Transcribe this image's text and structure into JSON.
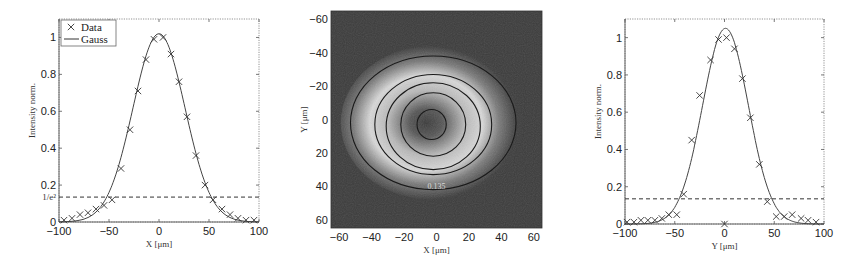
{
  "chart_data": [
    {
      "type": "scatter",
      "title": "",
      "xlabel": "X [μm]",
      "ylabel": "Intensity norm.",
      "xlim": [
        -100,
        100
      ],
      "ylim": [
        0,
        1.1
      ],
      "xticks": [
        -100,
        -50,
        0,
        50,
        100
      ],
      "yticks": [
        0,
        0.2,
        0.4,
        0.6,
        0.8,
        1
      ],
      "ytick_labels": [
        "0",
        "0.2",
        "0.4",
        "0.6",
        "0.8",
        "1"
      ],
      "extra_ytick": {
        "value": 0.135,
        "label": "1/e²"
      },
      "legend": {
        "position": "upper left",
        "entries": [
          "Data",
          "Gauss"
        ]
      },
      "threshold_line": {
        "y": 0.135,
        "style": "dashed"
      },
      "series": [
        {
          "name": "Data",
          "marker": "x",
          "x": [
            -95,
            -87,
            -79,
            -71,
            -63,
            -55,
            -47,
            -38,
            -29,
            -21,
            -13,
            -5,
            4,
            12,
            20,
            28,
            37,
            46,
            54,
            63,
            71,
            79,
            87,
            95
          ],
          "y": [
            0.01,
            0.02,
            0.04,
            0.05,
            0.07,
            0.09,
            0.12,
            0.29,
            0.5,
            0.71,
            0.88,
            0.99,
            1.0,
            0.91,
            0.76,
            0.57,
            0.36,
            0.2,
            0.12,
            0.07,
            0.04,
            0.02,
            0.01,
            0.01
          ]
        },
        {
          "name": "Gauss",
          "type": "line",
          "center": 0,
          "amplitude": 1.02,
          "w_1e2": 52
        }
      ]
    },
    {
      "type": "heatmap",
      "title": "",
      "xlabel": "X [μm]",
      "ylabel": "Y [μm]",
      "xlim": [
        -65,
        65
      ],
      "ylim": [
        -65,
        65
      ],
      "y_inverted": true,
      "xticks": [
        -60,
        -40,
        -20,
        0,
        20,
        40,
        60
      ],
      "yticks": [
        -60,
        -40,
        -20,
        0,
        20,
        40,
        60
      ],
      "colormap": "gray",
      "description": "Grayscale beam intensity image with bright annular ring and darker center",
      "contours": [
        {
          "level": "0.135",
          "cx": -2,
          "cy": 2,
          "rx": 51,
          "ry": 40
        },
        {
          "level": "0.5",
          "cx": -2,
          "cy": 3,
          "rx": 36,
          "ry": 30
        },
        {
          "level": "0.7",
          "cx": -2,
          "cy": 4,
          "rx": 29,
          "ry": 26
        },
        {
          "level": "0.9",
          "cx": -2,
          "cy": 3,
          "rx": 20,
          "ry": 19
        },
        {
          "level": "",
          "cx": -3,
          "cy": 3,
          "rx": 9,
          "ry": 9
        }
      ],
      "contour_labels": [
        {
          "text": "0.135",
          "x": 0,
          "y": 40
        }
      ]
    },
    {
      "type": "scatter",
      "title": "",
      "xlabel": "Y [μm]",
      "ylabel": "Intensity norm.",
      "xlim": [
        -100,
        100
      ],
      "ylim": [
        0,
        1.1
      ],
      "xticks": [
        -100,
        -50,
        0,
        50,
        100
      ],
      "yticks": [
        0,
        0.2,
        0.4,
        0.6,
        0.8,
        1
      ],
      "ytick_labels": [
        "0",
        "0.2",
        "0.4",
        "0.6",
        "0.8",
        "1"
      ],
      "threshold_line": {
        "y": 0.135,
        "style": "dashed"
      },
      "series": [
        {
          "name": "Data",
          "marker": "x",
          "x": [
            -98,
            -91,
            -84,
            -77,
            -70,
            -63,
            -56,
            -48,
            -41,
            -33,
            -25,
            -14,
            -6,
            0,
            2,
            10,
            18,
            26,
            35,
            43,
            52,
            60,
            68,
            77,
            84,
            92
          ],
          "y": [
            0.01,
            0.01,
            0.02,
            0.02,
            0.02,
            0.03,
            0.05,
            0.05,
            0.16,
            0.45,
            0.69,
            0.88,
            0.99,
            0.0,
            1.0,
            0.94,
            0.78,
            0.57,
            0.32,
            0.12,
            0.04,
            0.04,
            0.05,
            0.03,
            0.02,
            0.01
          ]
        },
        {
          "name": "Gauss",
          "type": "line",
          "center": 1,
          "amplitude": 1.05,
          "w_1e2": 46
        }
      ]
    }
  ]
}
